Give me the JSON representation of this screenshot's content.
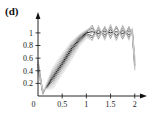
{
  "panel": {
    "label": "(d)"
  },
  "chart_data": {
    "type": "line",
    "title": "",
    "subtitle": "",
    "xlabel": "",
    "ylabel": "",
    "xlim": [
      0,
      2.15
    ],
    "ylim": [
      0,
      1.22
    ],
    "xticks": [
      0,
      0.5,
      1,
      1.5,
      2
    ],
    "xtick_labels": [
      "0",
      "0.5",
      "1",
      "1.5",
      "2"
    ],
    "yticks": [
      0.2,
      0.4,
      0.6,
      0.8,
      1
    ],
    "ytick_labels": [
      "0.2",
      "0.4",
      "0.6",
      "0.8",
      "1"
    ],
    "origin_label": "0",
    "grid": false,
    "legend": null,
    "axis_style": "arrowed-axes",
    "colors": {
      "main_trace": "#1a1a1a",
      "ensemble_light": "#9a9a9a",
      "ensemble_mid": "#5a5a5a",
      "axis": "#111111"
    },
    "series": [
      {
        "name": "trace-1",
        "shade": "#202020",
        "width": 1.0,
        "x": [
          0,
          0.1,
          0.3,
          0.5,
          0.7,
          0.85,
          1.0,
          1.12,
          1.25,
          1.38,
          1.5,
          1.62,
          1.75,
          1.88,
          1.95,
          2.0
        ],
        "y": [
          0.5,
          0.05,
          0.29,
          0.52,
          0.76,
          0.9,
          1.0,
          1.02,
          0.99,
          1.03,
          1.0,
          1.02,
          0.99,
          1.03,
          1.0,
          0.5
        ]
      },
      {
        "name": "trace-2",
        "shade": "#3a3a3a",
        "width": 0.9,
        "x": [
          0,
          0.1,
          0.3,
          0.5,
          0.7,
          0.85,
          1.0,
          1.12,
          1.25,
          1.38,
          1.5,
          1.62,
          1.75,
          1.88,
          1.95,
          2.0
        ],
        "y": [
          0.46,
          0.06,
          0.26,
          0.49,
          0.73,
          0.88,
          0.99,
          0.95,
          1.04,
          0.97,
          1.05,
          0.96,
          1.04,
          0.97,
          1.02,
          0.54
        ]
      },
      {
        "name": "trace-3",
        "shade": "#565656",
        "width": 0.8,
        "x": [
          0,
          0.1,
          0.3,
          0.5,
          0.7,
          0.85,
          1.0,
          1.12,
          1.25,
          1.38,
          1.5,
          1.62,
          1.75,
          1.88,
          1.95,
          2.0
        ],
        "y": [
          0.54,
          0.04,
          0.32,
          0.55,
          0.79,
          0.92,
          1.01,
          1.08,
          0.94,
          1.07,
          0.95,
          1.08,
          0.94,
          1.07,
          0.98,
          0.47
        ]
      },
      {
        "name": "trace-4",
        "shade": "#6e6e6e",
        "width": 0.8,
        "x": [
          0,
          0.1,
          0.3,
          0.5,
          0.7,
          0.85,
          1.0,
          1.12,
          1.25,
          1.38,
          1.5,
          1.62,
          1.75,
          1.88,
          1.95,
          2.0
        ],
        "y": [
          0.41,
          0.07,
          0.23,
          0.46,
          0.7,
          0.86,
          0.97,
          0.92,
          1.07,
          0.93,
          1.09,
          0.92,
          1.08,
          0.93,
          1.04,
          0.58
        ]
      },
      {
        "name": "trace-5",
        "shade": "#828282",
        "width": 0.75,
        "x": [
          0,
          0.1,
          0.3,
          0.5,
          0.7,
          0.85,
          1.0,
          1.12,
          1.25,
          1.38,
          1.5,
          1.62,
          1.75,
          1.88,
          1.95,
          2.0
        ],
        "y": [
          0.57,
          0.05,
          0.35,
          0.58,
          0.81,
          0.94,
          1.02,
          1.12,
          0.9,
          1.1,
          0.91,
          1.11,
          0.9,
          1.1,
          0.96,
          0.44
        ]
      },
      {
        "name": "trace-6",
        "shade": "#939393",
        "width": 0.7,
        "x": [
          0,
          0.1,
          0.3,
          0.5,
          0.7,
          0.85,
          1.0,
          1.12,
          1.25,
          1.38,
          1.5,
          1.62,
          1.75,
          1.88,
          1.95,
          2.0
        ],
        "y": [
          0.38,
          0.08,
          0.2,
          0.43,
          0.67,
          0.84,
          0.96,
          0.89,
          1.1,
          0.9,
          1.12,
          0.89,
          1.11,
          0.9,
          1.06,
          0.61
        ]
      },
      {
        "name": "trace-7",
        "shade": "#a2a2a2",
        "width": 0.7,
        "x": [
          0,
          0.1,
          0.3,
          0.5,
          0.7,
          0.85,
          1.0,
          1.12,
          1.25,
          1.38,
          1.5,
          1.62,
          1.75,
          1.88,
          1.95,
          2.0
        ],
        "y": [
          0.52,
          0.03,
          0.38,
          0.61,
          0.83,
          0.95,
          1.03,
          1.05,
          1.01,
          1.0,
          1.03,
          1.0,
          1.02,
          1.01,
          1.0,
          0.49
        ]
      },
      {
        "name": "trace-8",
        "shade": "#b0b0b0",
        "width": 0.65,
        "x": [
          0,
          0.1,
          0.3,
          0.5,
          0.7,
          0.85,
          1.0,
          1.12,
          1.25,
          1.38,
          1.5,
          1.62,
          1.75,
          1.88,
          1.95,
          2.0
        ],
        "y": [
          0.44,
          0.09,
          0.17,
          0.4,
          0.64,
          0.82,
          0.95,
          1.0,
          0.97,
          1.01,
          0.98,
          1.02,
          0.97,
          1.02,
          0.99,
          0.56
        ]
      },
      {
        "name": "trace-9",
        "shade": "#bcbcbc",
        "width": 0.65,
        "x": [
          0,
          0.1,
          0.3,
          0.5,
          0.7,
          0.85,
          1.0,
          1.12,
          1.25,
          1.38,
          1.5,
          1.62,
          1.75,
          1.88,
          1.95,
          2.0
        ],
        "y": [
          0.49,
          0.02,
          0.41,
          0.64,
          0.85,
          0.96,
          1.04,
          1.1,
          0.92,
          1.09,
          0.93,
          1.1,
          0.92,
          1.09,
          0.97,
          0.42
        ]
      },
      {
        "name": "trace-10",
        "shade": "#c6c6c6",
        "width": 0.6,
        "x": [
          0,
          0.1,
          0.3,
          0.5,
          0.7,
          0.85,
          1.0,
          1.12,
          1.25,
          1.38,
          1.5,
          1.62,
          1.75,
          1.88,
          1.95,
          2.0
        ],
        "y": [
          0.36,
          0.1,
          0.14,
          0.37,
          0.61,
          0.8,
          0.93,
          0.87,
          1.12,
          0.88,
          1.14,
          0.87,
          1.13,
          0.88,
          1.08,
          0.63
        ]
      },
      {
        "name": "trace-11",
        "shade": "#cfcfcf",
        "width": 0.6,
        "x": [
          0,
          0.1,
          0.3,
          0.5,
          0.7,
          0.85,
          1.0,
          1.12,
          1.25,
          1.38,
          1.5,
          1.62,
          1.75,
          1.88,
          1.95,
          2.0
        ],
        "y": [
          0.59,
          0.06,
          0.44,
          0.67,
          0.87,
          0.97,
          1.05,
          1.03,
          1.06,
          0.99,
          1.07,
          0.98,
          1.06,
          0.99,
          1.03,
          0.4
        ]
      },
      {
        "name": "trace-12",
        "shade": "#d6d6d6",
        "width": 0.6,
        "x": [
          0,
          0.1,
          0.3,
          0.5,
          0.7,
          0.85,
          1.0,
          1.12,
          1.25,
          1.38,
          1.5,
          1.62,
          1.75,
          1.88,
          1.95,
          2.0
        ],
        "y": [
          0.33,
          0.11,
          0.11,
          0.34,
          0.58,
          0.78,
          0.91,
          0.96,
          0.93,
          1.05,
          0.94,
          1.06,
          0.93,
          1.05,
          0.95,
          0.66
        ]
      }
    ]
  }
}
